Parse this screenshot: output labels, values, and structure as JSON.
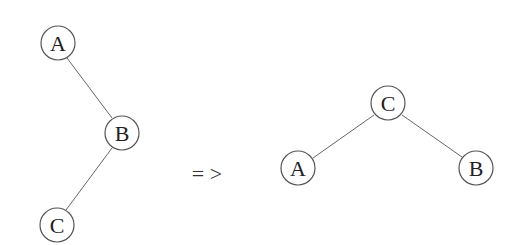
{
  "diagram": {
    "type": "tree-rotation",
    "arrow": "= >",
    "before": {
      "nodes": [
        {
          "id": "A",
          "label": "A",
          "cx": 58,
          "cy": 43
        },
        {
          "id": "B",
          "label": "B",
          "cx": 122,
          "cy": 133
        },
        {
          "id": "C",
          "label": "C",
          "cx": 57,
          "cy": 225
        }
      ],
      "edges": [
        [
          "A",
          "B"
        ],
        [
          "B",
          "C"
        ]
      ]
    },
    "after": {
      "nodes": [
        {
          "id": "C",
          "label": "C",
          "cx": 388,
          "cy": 103
        },
        {
          "id": "A",
          "label": "A",
          "cx": 298,
          "cy": 168
        },
        {
          "id": "B",
          "label": "B",
          "cx": 476,
          "cy": 168
        }
      ],
      "edges": [
        [
          "C",
          "A"
        ],
        [
          "C",
          "B"
        ]
      ]
    }
  }
}
